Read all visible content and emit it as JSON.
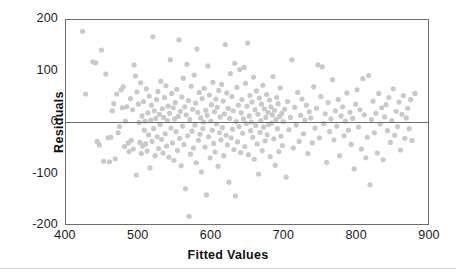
{
  "chart_data": {
    "type": "scatter",
    "title": "",
    "subtitle": "",
    "xlabel": "Fitted Values",
    "ylabel": "Residuals",
    "xlim": [
      400,
      900
    ],
    "ylim": [
      -200,
      200
    ],
    "xticks": [
      400,
      500,
      600,
      700,
      800,
      900
    ],
    "yticks": [
      200,
      100,
      0,
      -100,
      -200
    ],
    "xtick_labels": [
      "400",
      "500",
      "600",
      "700",
      "800",
      "900"
    ],
    "ytick_labels": [
      "200",
      "100",
      "0",
      "-100",
      "-200"
    ],
    "grid": false,
    "legend": null,
    "legend_position": "none",
    "point_color": "#c9c9c9",
    "point_size": 2.6,
    "point_marker": "circle",
    "frame_color": "#6e6e6e",
    "reference_lines": [
      {
        "name": "zero-residual-line",
        "orientation": "horizontal",
        "y": 0,
        "color": "#6e6e6e"
      }
    ],
    "n_points": 300,
    "points": [
      [
        423,
        178
      ],
      [
        427,
        55
      ],
      [
        437,
        118
      ],
      [
        441,
        116
      ],
      [
        443,
        -38
      ],
      [
        446,
        -45
      ],
      [
        449,
        141
      ],
      [
        452,
        -77
      ],
      [
        455,
        94
      ],
      [
        458,
        -31
      ],
      [
        460,
        -78
      ],
      [
        462,
        -30
      ],
      [
        464,
        22
      ],
      [
        466,
        36
      ],
      [
        468,
        -72
      ],
      [
        470,
        55
      ],
      [
        472,
        -21
      ],
      [
        474,
        -9
      ],
      [
        476,
        63
      ],
      [
        478,
        28
      ],
      [
        479,
        69
      ],
      [
        481,
        -48
      ],
      [
        482,
        2
      ],
      [
        484,
        30
      ],
      [
        486,
        -41
      ],
      [
        487,
        -58
      ],
      [
        489,
        46
      ],
      [
        490,
        -36
      ],
      [
        492,
        24
      ],
      [
        493,
        -53
      ],
      [
        494,
        112
      ],
      [
        496,
        90
      ],
      [
        497,
        -104
      ],
      [
        498,
        59
      ],
      [
        500,
        35
      ],
      [
        501,
        -1
      ],
      [
        502,
        -40
      ],
      [
        503,
        77
      ],
      [
        504,
        -62
      ],
      [
        505,
        12
      ],
      [
        506,
        -47
      ],
      [
        507,
        40
      ],
      [
        508,
        -16
      ],
      [
        509,
        2
      ],
      [
        510,
        -43
      ],
      [
        511,
        65
      ],
      [
        512,
        -57
      ],
      [
        513,
        18
      ],
      [
        514,
        -25
      ],
      [
        515,
        51
      ],
      [
        516,
        -90
      ],
      [
        517,
        4
      ],
      [
        518,
        33
      ],
      [
        519,
        -38
      ],
      [
        520,
        167
      ],
      [
        521,
        -13
      ],
      [
        522,
        22
      ],
      [
        523,
        -66
      ],
      [
        524,
        7
      ],
      [
        525,
        44
      ],
      [
        526,
        -29
      ],
      [
        527,
        60
      ],
      [
        528,
        -52
      ],
      [
        529,
        15
      ],
      [
        530,
        -5
      ],
      [
        531,
        80
      ],
      [
        532,
        -34
      ],
      [
        533,
        26
      ],
      [
        534,
        -61
      ],
      [
        535,
        9
      ],
      [
        536,
        48
      ],
      [
        537,
        -23
      ],
      [
        538,
        71
      ],
      [
        539,
        -47
      ],
      [
        540,
        3
      ],
      [
        541,
        31
      ],
      [
        542,
        -69
      ],
      [
        543,
        17
      ],
      [
        544,
        122
      ],
      [
        545,
        -12
      ],
      [
        546,
        56
      ],
      [
        547,
        -41
      ],
      [
        548,
        28
      ],
      [
        549,
        -75
      ],
      [
        550,
        6
      ],
      [
        551,
        38
      ],
      [
        552,
        -19
      ],
      [
        553,
        64
      ],
      [
        554,
        -56
      ],
      [
        555,
        11
      ],
      [
        556,
        161
      ],
      [
        557,
        -32
      ],
      [
        558,
        21
      ],
      [
        559,
        -86
      ],
      [
        560,
        49
      ],
      [
        561,
        -8
      ],
      [
        562,
        86
      ],
      [
        563,
        -44
      ],
      [
        564,
        30
      ],
      [
        565,
        -131
      ],
      [
        566,
        14
      ],
      [
        567,
        113
      ],
      [
        568,
        -27
      ],
      [
        569,
        42
      ],
      [
        570,
        -185
      ],
      [
        571,
        5
      ],
      [
        572,
        -63
      ],
      [
        573,
        70
      ],
      [
        574,
        -18
      ],
      [
        575,
        25
      ],
      [
        576,
        -51
      ],
      [
        577,
        92
      ],
      [
        578,
        -6
      ],
      [
        579,
        37
      ],
      [
        580,
        -80
      ],
      [
        581,
        143
      ],
      [
        582,
        19
      ],
      [
        583,
        -36
      ],
      [
        584,
        58
      ],
      [
        585,
        -24
      ],
      [
        586,
        8
      ],
      [
        587,
        -98
      ],
      [
        588,
        46
      ],
      [
        589,
        -13
      ],
      [
        590,
        0
      ],
      [
        591,
        66
      ],
      [
        592,
        -49
      ],
      [
        593,
        23
      ],
      [
        594,
        -143
      ],
      [
        595,
        13
      ],
      [
        596,
        110
      ],
      [
        597,
        -29
      ],
      [
        598,
        53
      ],
      [
        599,
        -70
      ],
      [
        600,
        2
      ],
      [
        601,
        34
      ],
      [
        602,
        -16
      ],
      [
        603,
        78
      ],
      [
        604,
        -42
      ],
      [
        605,
        20
      ],
      [
        606,
        -59
      ],
      [
        607,
        45
      ],
      [
        608,
        -4
      ],
      [
        609,
        29
      ],
      [
        610,
        -87
      ],
      [
        611,
        62
      ],
      [
        612,
        -21
      ],
      [
        613,
        10
      ],
      [
        614,
        -35
      ],
      [
        615,
        74
      ],
      [
        616,
        -11
      ],
      [
        617,
        41
      ],
      [
        618,
        -66
      ],
      [
        619,
        16
      ],
      [
        620,
        152
      ],
      [
        621,
        -26
      ],
      [
        622,
        57
      ],
      [
        623,
        -45
      ],
      [
        624,
        27
      ],
      [
        625,
        -118
      ],
      [
        626,
        7
      ],
      [
        627,
        95
      ],
      [
        628,
        -31
      ],
      [
        629,
        50
      ],
      [
        630,
        -14
      ],
      [
        631,
        22
      ],
      [
        632,
        -54
      ],
      [
        633,
        115
      ],
      [
        634,
        -145
      ],
      [
        635,
        1
      ],
      [
        636,
        68
      ],
      [
        637,
        -39
      ],
      [
        638,
        33
      ],
      [
        639,
        -9
      ],
      [
        640,
        103
      ],
      [
        641,
        -60
      ],
      [
        642,
        18
      ],
      [
        643,
        44
      ],
      [
        644,
        -22
      ],
      [
        645,
        6
      ],
      [
        646,
        107
      ],
      [
        647,
        -48
      ],
      [
        648,
        76
      ],
      [
        649,
        -3
      ],
      [
        650,
        31
      ],
      [
        651,
        155
      ],
      [
        652,
        -64
      ],
      [
        653,
        12
      ],
      [
        654,
        52
      ],
      [
        655,
        -17
      ],
      [
        656,
        0
      ],
      [
        657,
        39
      ],
      [
        658,
        -30
      ],
      [
        659,
        88
      ],
      [
        660,
        -73
      ],
      [
        661,
        24
      ],
      [
        662,
        -7
      ],
      [
        663,
        61
      ],
      [
        664,
        -43
      ],
      [
        665,
        15
      ],
      [
        666,
        -102
      ],
      [
        667,
        47
      ],
      [
        668,
        -20
      ],
      [
        669,
        3
      ],
      [
        670,
        35
      ],
      [
        671,
        -56
      ],
      [
        672,
        72
      ],
      [
        673,
        -10
      ],
      [
        674,
        26
      ],
      [
        675,
        -37
      ],
      [
        676,
        9
      ],
      [
        677,
        54
      ],
      [
        678,
        -25
      ],
      [
        679,
        19
      ],
      [
        680,
        -5
      ],
      [
        681,
        43
      ],
      [
        682,
        -68
      ],
      [
        683,
        30
      ],
      [
        684,
        -2
      ],
      [
        685,
        14
      ],
      [
        686,
        89
      ],
      [
        687,
        -33
      ],
      [
        688,
        23
      ],
      [
        689,
        -85
      ],
      [
        690,
        5
      ],
      [
        691,
        48
      ],
      [
        692,
        -13
      ],
      [
        693,
        36
      ],
      [
        694,
        -58
      ],
      [
        695,
        11
      ],
      [
        696,
        67
      ],
      [
        697,
        -28
      ],
      [
        698,
        17
      ],
      [
        699,
        -46
      ],
      [
        700,
        1
      ],
      [
        702,
        25
      ],
      [
        704,
        -108
      ],
      [
        706,
        40
      ],
      [
        708,
        -15
      ],
      [
        710,
        9
      ],
      [
        712,
        122
      ],
      [
        714,
        -51
      ],
      [
        716,
        29
      ],
      [
        718,
        -6
      ],
      [
        720,
        58
      ],
      [
        722,
        -38
      ],
      [
        724,
        13
      ],
      [
        726,
        45
      ],
      [
        728,
        -23
      ],
      [
        730,
        4
      ],
      [
        732,
        33
      ],
      [
        734,
        -62
      ],
      [
        736,
        20
      ],
      [
        738,
        8
      ],
      [
        740,
        -41
      ],
      [
        742,
        69
      ],
      [
        744,
        -12
      ],
      [
        746,
        27
      ],
      [
        748,
        112
      ],
      [
        750,
        -31
      ],
      [
        752,
        50
      ],
      [
        754,
        108
      ],
      [
        756,
        -3
      ],
      [
        758,
        16
      ],
      [
        760,
        -79
      ],
      [
        762,
        38
      ],
      [
        764,
        -19
      ],
      [
        766,
        6
      ],
      [
        768,
        83
      ],
      [
        770,
        -35
      ],
      [
        772,
        22
      ],
      [
        774,
        -8
      ],
      [
        776,
        44
      ],
      [
        778,
        -66
      ],
      [
        780,
        12
      ],
      [
        782,
        30
      ],
      [
        784,
        -27
      ],
      [
        786,
        2
      ],
      [
        788,
        57
      ],
      [
        790,
        -16
      ],
      [
        792,
        19
      ],
      [
        794,
        -44
      ],
      [
        796,
        7
      ],
      [
        798,
        -92
      ],
      [
        800,
        35
      ],
      [
        802,
        63
      ],
      [
        804,
        -10
      ],
      [
        806,
        24
      ],
      [
        808,
        -53
      ],
      [
        810,
        85
      ],
      [
        812,
        14
      ],
      [
        814,
        -70
      ],
      [
        816,
        -30
      ],
      [
        818,
        91
      ],
      [
        820,
        -123
      ],
      [
        822,
        5
      ],
      [
        824,
        41
      ],
      [
        826,
        -21
      ],
      [
        828,
        17
      ],
      [
        830,
        -61
      ],
      [
        832,
        56
      ],
      [
        834,
        -4
      ],
      [
        836,
        28
      ],
      [
        838,
        -74
      ],
      [
        840,
        10
      ],
      [
        842,
        34
      ],
      [
        844,
        -17
      ],
      [
        846,
        48
      ],
      [
        848,
        -40
      ],
      [
        850,
        3
      ],
      [
        852,
        65
      ],
      [
        854,
        -26
      ],
      [
        856,
        21
      ],
      [
        858,
        -9
      ],
      [
        860,
        39
      ],
      [
        862,
        -55
      ],
      [
        864,
        15
      ],
      [
        866,
        52
      ],
      [
        868,
        -32
      ],
      [
        870,
        8
      ],
      [
        872,
        27
      ],
      [
        874,
        -13
      ],
      [
        876,
        44
      ],
      [
        878,
        -36
      ],
      [
        882,
        56
      ]
    ]
  },
  "axes": {
    "x": {
      "label": "Fitted Values",
      "ticks": [
        {
          "value": 400,
          "label": "400"
        },
        {
          "value": 500,
          "label": "500"
        },
        {
          "value": 600,
          "label": "600"
        },
        {
          "value": 700,
          "label": "700"
        },
        {
          "value": 800,
          "label": "800"
        },
        {
          "value": 900,
          "label": "900"
        }
      ]
    },
    "y": {
      "label": "Residuals",
      "ticks": [
        {
          "value": 200,
          "label": "200"
        },
        {
          "value": 100,
          "label": "100"
        },
        {
          "value": 0,
          "label": "0"
        },
        {
          "value": -100,
          "label": "-100"
        },
        {
          "value": -200,
          "label": "-200"
        }
      ]
    }
  },
  "colors": {
    "point": "#c9c9c9",
    "frame": "#6e6e6e",
    "zero_line": "#6e6e6e",
    "text": "#111111",
    "background": "#ffffff",
    "bottom_rule": "#d8d8d8"
  }
}
